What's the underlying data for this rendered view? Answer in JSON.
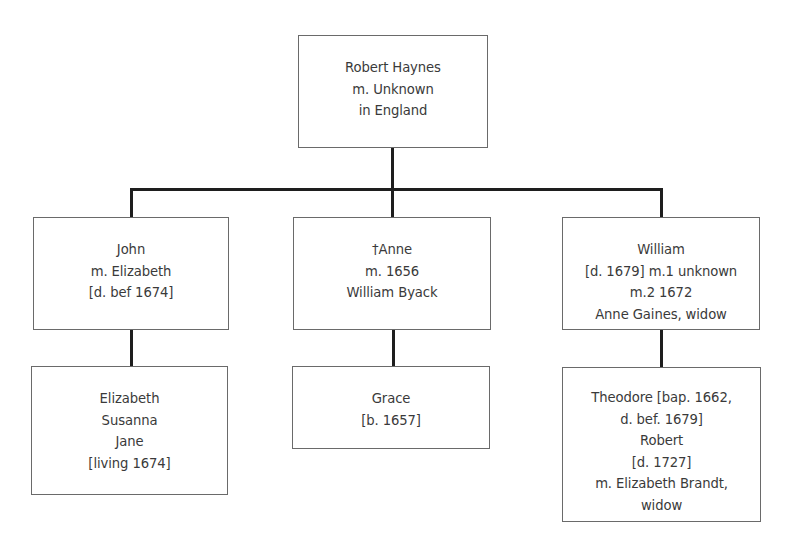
{
  "diagram": {
    "type": "family-tree",
    "root": {
      "id": "robert-haynes",
      "lines": [
        "Robert Haynes",
        "m. Unknown",
        "in England"
      ]
    },
    "children": [
      {
        "id": "john",
        "lines": [
          "John",
          "m. Elizabeth",
          "[d. bef 1674]"
        ],
        "children_box": {
          "lines": [
            "Elizabeth",
            "Susanna",
            "Jane",
            "[living 1674]"
          ]
        }
      },
      {
        "id": "anne",
        "lines": [
          "†Anne",
          "m. 1656",
          "William Byack"
        ],
        "children_box": {
          "lines": [
            "Grace",
            "[b. 1657]"
          ]
        }
      },
      {
        "id": "william",
        "lines": [
          "William",
          "[d. 1679] m.1 unknown",
          "m.2 1672",
          "Anne Gaines, widow"
        ],
        "children_box": {
          "lines": [
            "Theodore [bap. 1662,",
            "d. bef. 1679]",
            "Robert",
            "[d. 1727]",
            "m.  Elizabeth Brandt,",
            "widow"
          ]
        }
      }
    ]
  }
}
